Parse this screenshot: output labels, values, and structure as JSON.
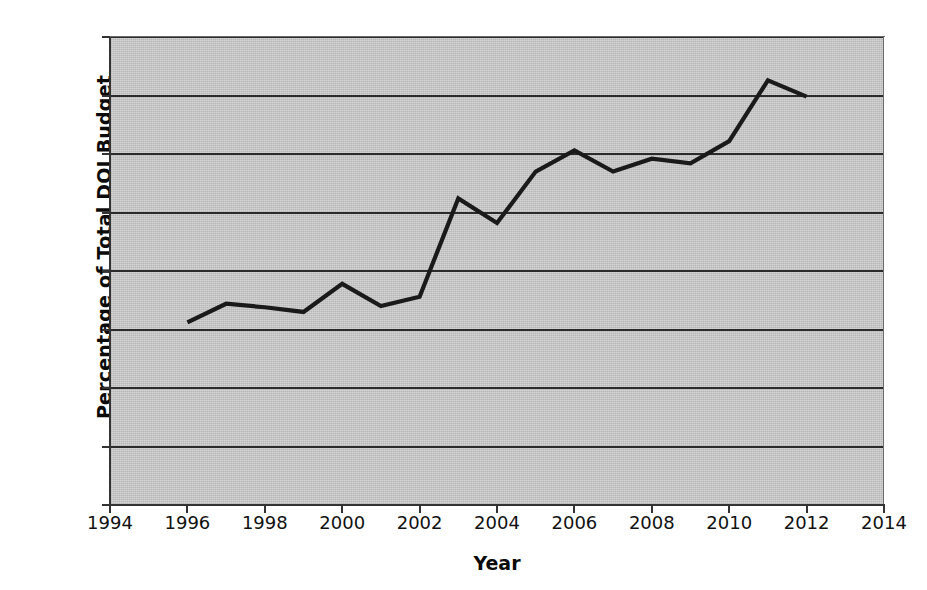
{
  "chart_data": {
    "type": "line",
    "title": "",
    "xlabel": "Year",
    "ylabel": "Percentage of Total DOJ Budget",
    "xlim": [
      1994,
      2014
    ],
    "ylim": [
      0,
      0.4
    ],
    "xticks": [
      "1994",
      "1996",
      "1998",
      "2000",
      "2002",
      "2004",
      "2006",
      "2008",
      "2010",
      "2012",
      "2014"
    ],
    "yticks": [
      "0",
      "0.05",
      "0.1",
      "0.15",
      "0.2",
      "0.25",
      "0.3",
      "0.35",
      "0.4"
    ],
    "grid": "horizontal",
    "legend": "none",
    "x": [
      1996,
      1997,
      1998,
      1999,
      2000,
      2001,
      2002,
      2003,
      2004,
      2005,
      2006,
      2007,
      2008,
      2009,
      2010,
      2011,
      2012
    ],
    "values": [
      0.156,
      0.172,
      0.169,
      0.165,
      0.189,
      0.17,
      0.178,
      0.262,
      0.241,
      0.285,
      0.303,
      0.285,
      0.296,
      0.292,
      0.311,
      0.363,
      0.349
    ],
    "series": [
      {
        "name": "Percentage of Total DOJ Budget",
        "color": "#1a1a1a",
        "values": [
          0.156,
          0.172,
          0.169,
          0.165,
          0.189,
          0.17,
          0.178,
          0.262,
          0.241,
          0.285,
          0.303,
          0.285,
          0.296,
          0.292,
          0.311,
          0.363,
          0.349
        ]
      }
    ],
    "colors": {
      "plot_background": "#c9c9c9",
      "gridline": "#2b2b2b",
      "axis": "#333333",
      "line": "#1a1a1a",
      "text": "#111111",
      "figure_background": "#ffffff"
    }
  }
}
